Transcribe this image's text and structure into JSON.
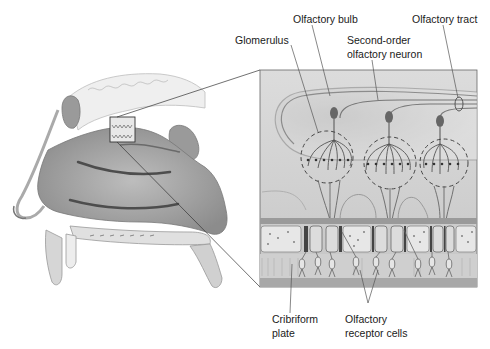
{
  "diagram": {
    "type": "anatomical-illustration",
    "panels": [
      {
        "id": "head",
        "description": "sagittal section of nasal cavity"
      },
      {
        "id": "inset",
        "description": "magnified olfactory epithelium and bulb"
      }
    ],
    "labels": {
      "olfactory_bulb": "Olfactory bulb",
      "olfactory_tract": "Olfactory tract",
      "glomerulus": "Glomerulus",
      "second_order_line1": "Second-order",
      "second_order_line2": "olfactory neuron",
      "cribriform_line1": "Cribriform",
      "cribriform_line2": "plate",
      "receptor_line1": "Olfactory",
      "receptor_line2": "receptor cells"
    },
    "colors": {
      "background": "#ffffff",
      "text": "#1a1a1a",
      "leader": "#555555",
      "inset_bg": "#d9d9d9",
      "tissue_dark": "#8a8a8a",
      "tissue_mid": "#b5b5b5",
      "tissue_light": "#e6e6e6"
    }
  }
}
